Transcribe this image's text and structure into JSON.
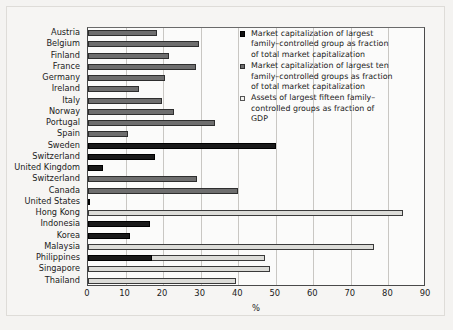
{
  "chart_data": {
    "type": "bar",
    "orientation": "horizontal",
    "title": "",
    "xlabel": "%",
    "ylabel": "",
    "xlim": [
      0,
      90
    ],
    "xticks": [
      0,
      10,
      20,
      30,
      40,
      50,
      60,
      70,
      80,
      90
    ],
    "grid": true,
    "legend_position": "upper right",
    "categories": [
      "Austria",
      "Belgium",
      "Finland",
      "France",
      "Germany",
      "Ireland",
      "Italy",
      "Norway",
      "Portugal",
      "Spain",
      "Sweden",
      "Switzerland",
      "United Kingdom",
      "Switzerland",
      "Canada",
      "United States",
      "Hong Kong",
      "Indonesia",
      "Korea",
      "Malaysia",
      "Philippines",
      "Singapore",
      "Thailand"
    ],
    "series": [
      {
        "name": "Market capitalization of largest family-controlled group as fraction of total market capitalization",
        "key": "s0",
        "color": "#1a1a1a",
        "values": [
          null,
          null,
          null,
          null,
          null,
          null,
          null,
          null,
          null,
          null,
          50.0,
          17.8,
          4.0,
          null,
          null,
          0.6,
          null,
          16.5,
          11.3,
          null,
          17.0,
          null,
          null
        ]
      },
      {
        "name": "Market capitalization of largest ten family-controlled groups as fraction of total market capitalization",
        "key": "s1",
        "color": "#6e6e6e",
        "values": [
          18.5,
          29.5,
          21.5,
          28.7,
          20.6,
          13.6,
          19.7,
          22.8,
          33.8,
          10.7,
          null,
          null,
          null,
          29.0,
          40.0,
          null,
          null,
          null,
          null,
          null,
          null,
          null,
          null
        ]
      },
      {
        "name": "Assets of largest fifteen family-controlled groups as fraction of GDP",
        "key": "s2",
        "color": "#dcdcd8",
        "values": [
          null,
          null,
          null,
          null,
          null,
          null,
          null,
          null,
          null,
          null,
          null,
          null,
          null,
          null,
          null,
          null,
          84.0,
          null,
          null,
          76.2,
          47.0,
          48.5,
          39.5
        ]
      }
    ],
    "legend": [
      {
        "swatch": "s0",
        "lines": [
          "Market capitalization of largest",
          "family–controlled group as fraction",
          "of total market capitalization"
        ]
      },
      {
        "swatch": "s1",
        "lines": [
          "Market capitalization of largest ten",
          "family–controlled groups as fraction",
          "of total market capitalization"
        ]
      },
      {
        "swatch": "s2",
        "lines": [
          "Assets of largest fifteen family–",
          "controlled groups as fraction of",
          "GDP"
        ]
      }
    ]
  },
  "colors": {
    "series_black": "#1a1a1a",
    "series_gray": "#6e6e6e",
    "series_light": "#dcdcd8",
    "page_background": "#f4f3f1",
    "plot_background": "#fbfbfa",
    "gridline": "#c9c7c3",
    "axis": "#4a4a4a",
    "text": "#1b1b1b"
  }
}
